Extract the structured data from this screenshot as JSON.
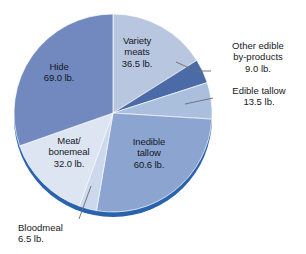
{
  "chart_data": {
    "type": "pie",
    "title": "",
    "unit": "lb.",
    "total": 227.1,
    "categories": [
      "Variety meats",
      "Other edible by-products",
      "Edible tallow",
      "Inedible tallow",
      "Bloodmeal",
      "Meat/bonemeal",
      "Hide"
    ],
    "values": [
      36.5,
      9.0,
      13.5,
      60.6,
      6.5,
      32.0,
      69.0
    ],
    "slices": [
      {
        "name": "Variety meats",
        "label": "Variety\nmeats\n36.5 lb.",
        "value": 36.5,
        "value_text": "36.5 lb.",
        "color": "#b8c6e0",
        "start_deg": 0.0,
        "sweep_deg": 57.86,
        "label_placement": "inside"
      },
      {
        "name": "Other edible by-products",
        "label": "Other edible\nby-products\n9.0 lb.",
        "value": 9.0,
        "value_text": "9.0 lb.",
        "color": "#4a6aa8",
        "start_deg": 57.86,
        "sweep_deg": 14.27,
        "label_placement": "callout"
      },
      {
        "name": "Edible tallow",
        "label": "Edible tallow\n13.5 lb.",
        "value": 13.5,
        "value_text": "13.5 lb.",
        "color": "#aabfdd",
        "start_deg": 72.13,
        "sweep_deg": 21.4,
        "label_placement": "callout"
      },
      {
        "name": "Inedible tallow",
        "label": "Inedible\ntallow\n60.6 lb.",
        "value": 60.6,
        "value_text": "60.6 lb.",
        "color": "#8ba4d0",
        "start_deg": 93.53,
        "sweep_deg": 96.06,
        "label_placement": "inside"
      },
      {
        "name": "Bloodmeal",
        "label": "Bloodmeal\n6.5 lb.",
        "value": 6.5,
        "value_text": "6.5 lb.",
        "color": "#ccd8ec",
        "start_deg": 189.59,
        "sweep_deg": 10.3,
        "label_placement": "callout"
      },
      {
        "name": "Meat/bonemeal",
        "label": "Meat/\nbonemeal\n32.0 lb.",
        "value": 32.0,
        "value_text": "32.0 lb.",
        "color": "#dde5f2",
        "start_deg": 199.89,
        "sweep_deg": 50.73,
        "label_placement": "inside"
      },
      {
        "name": "Hide",
        "label": "Hide\n69.0 lb.",
        "value": 69.0,
        "value_text": "69.0 lb.",
        "color": "#7189bf",
        "start_deg": 250.62,
        "sweep_deg": 109.38,
        "label_placement": "inside"
      }
    ],
    "geometry": {
      "center_x": 113,
      "center_y": 113,
      "radius": 99,
      "rim_color": "#2a63ad",
      "rim_offset_y": 5
    },
    "legend": "none",
    "grid": false
  },
  "labels": {
    "variety_meats": "Variety\nmeats\n36.5 lb.",
    "hide": "Hide\n69.0 lb.",
    "meat_bonemeal": "Meat/\nbonemeal\n32.0 lb.",
    "inedible_tallow": "Inedible\ntallow\n60.6 lb.",
    "other_edible": "Other edible\nby-products\n9.0 lb.",
    "edible_tallow": "Edible tallow\n13.5 lb.",
    "bloodmeal": "Bloodmeal\n6.5 lb."
  }
}
